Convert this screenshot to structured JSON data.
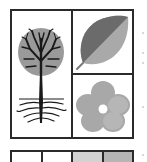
{
  "figure": {
    "panels": [
      {
        "id": "tree",
        "label": "tree-with-roots",
        "canopy_color": "#9a9a9a",
        "branch_color": "#1a1a1a"
      },
      {
        "id": "leaf",
        "label": "leaf",
        "dark_half": "#6b6b6b",
        "light_half": "#a9a9a9"
      },
      {
        "id": "flower",
        "label": "flower",
        "petal_color": "#a8a8a8",
        "center_color": "#ffffff"
      }
    ],
    "strip": {
      "cells": [
        {
          "index": 1,
          "fill": "#ffffff"
        },
        {
          "index": 2,
          "fill": "#ffffff"
        },
        {
          "index": 3,
          "fill": "#d2d2d2"
        },
        {
          "index": 4,
          "fill": "#b5b5b5"
        }
      ]
    },
    "colors": {
      "border": "#2a2a2a",
      "background": "#ffffff"
    }
  }
}
